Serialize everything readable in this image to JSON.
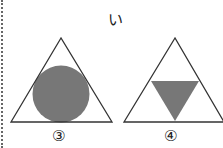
{
  "heading": "い",
  "figures": [
    {
      "id": "3",
      "label": "③",
      "outer_shape": "triangle",
      "inner_shape": "circle",
      "inner_fill": "#777777"
    },
    {
      "id": "4",
      "label": "④",
      "outer_shape": "triangle",
      "inner_shape": "inverted-triangle",
      "inner_fill": "#777777"
    }
  ],
  "colors": {
    "stroke": "#333333",
    "fill": "#777777",
    "divider": "#666666"
  }
}
